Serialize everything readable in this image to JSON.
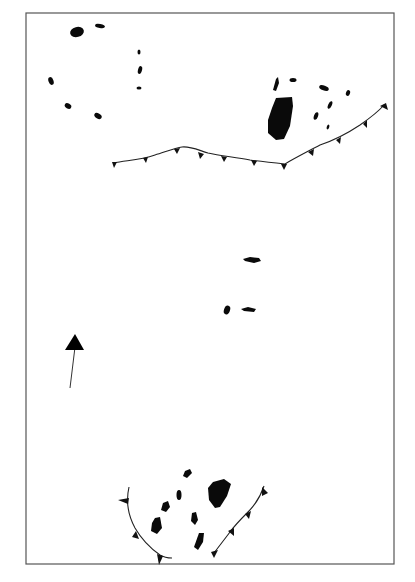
{
  "figure": {
    "type": "schematic map",
    "frame": {
      "x": 26,
      "y": 13,
      "width": 368,
      "height": 551,
      "stroke": "#555555"
    },
    "colors": {
      "landmass": "#0a0a0a",
      "front": "#222222",
      "background": "#ffffff"
    },
    "north_arrow": {
      "icon": "north-arrow-icon",
      "from": [
        70,
        388
      ],
      "to": [
        75,
        340
      ]
    },
    "fronts": [
      {
        "name": "upper-thrust-front",
        "teeth_count": 12
      },
      {
        "name": "lower-left-arc-front",
        "teeth_count": 4
      },
      {
        "name": "lower-right-arc-front",
        "teeth_count": 5
      }
    ],
    "caption": {
      "text": "",
      "legible": false
    }
  }
}
